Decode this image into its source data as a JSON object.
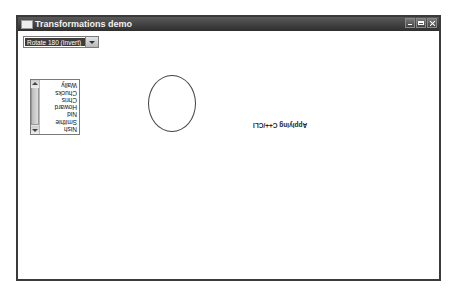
{
  "window": {
    "title": "Transformations demo",
    "controls": [
      "minimize",
      "maximize",
      "close"
    ]
  },
  "combo": {
    "selected": "Rotate 180 (Invert)"
  },
  "listbox": {
    "items": [
      "Nish",
      "Smithie",
      "Nid",
      "Howard",
      "Chris",
      "Chucks",
      "Wally"
    ]
  },
  "label": {
    "text": "Applying C++/CLI"
  },
  "colors": {
    "titlebar": "#3a3a3a",
    "border": "#3a3a3a",
    "combo_selected_bg": "#3c3c3c"
  }
}
